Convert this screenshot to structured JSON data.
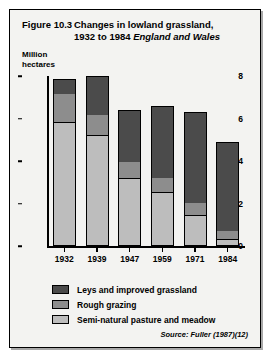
{
  "figure": {
    "number": "Figure 10.3",
    "title_line1": "Changes in lowland grassland,",
    "title_line2_plain": "1932 to 1984",
    "title_line2_italic": "England and Wales",
    "source": "Source: Fuller (1987)(12)"
  },
  "legend": {
    "items": [
      {
        "label": "Leys and improved grassland",
        "swatch": "dark",
        "color": "#4b4b4b"
      },
      {
        "label": "Rough grazing",
        "swatch": "mid",
        "color": "#8d8d8d"
      },
      {
        "label": "Semi-natural pasture and meadow",
        "swatch": "light",
        "color": "#bdbdbd"
      }
    ]
  },
  "chart_data": {
    "type": "bar",
    "subtitle": "",
    "xlabel": "",
    "ylabel": "Million hectares",
    "ylabel_line1": "Million",
    "ylabel_line2": "hectares",
    "stacked": true,
    "grid": false,
    "legend_position": "bottom-left",
    "ylim": [
      0,
      8
    ],
    "yticks": [
      0,
      2,
      4,
      6,
      8
    ],
    "ytick_labels": [
      "0",
      "2",
      "4",
      "6",
      "8"
    ],
    "categories": [
      "1932",
      "1939",
      "1947",
      "1959",
      "1971",
      "1984"
    ],
    "series": [
      {
        "name": "Semi-natural pasture and meadow",
        "color": "#bdbdbd",
        "values": [
          5.8,
          5.2,
          3.15,
          2.5,
          1.4,
          0.25
        ]
      },
      {
        "name": "Rough grazing",
        "color": "#8d8d8d",
        "values": [
          1.4,
          1.0,
          0.8,
          0.7,
          0.6,
          0.4
        ]
      },
      {
        "name": "Leys and improved grassland",
        "color": "#4b4b4b",
        "values": [
          0.65,
          1.8,
          2.45,
          3.4,
          4.3,
          4.25
        ]
      }
    ],
    "totals": [
      7.85,
      8.0,
      6.4,
      6.6,
      6.3,
      4.9
    ]
  }
}
